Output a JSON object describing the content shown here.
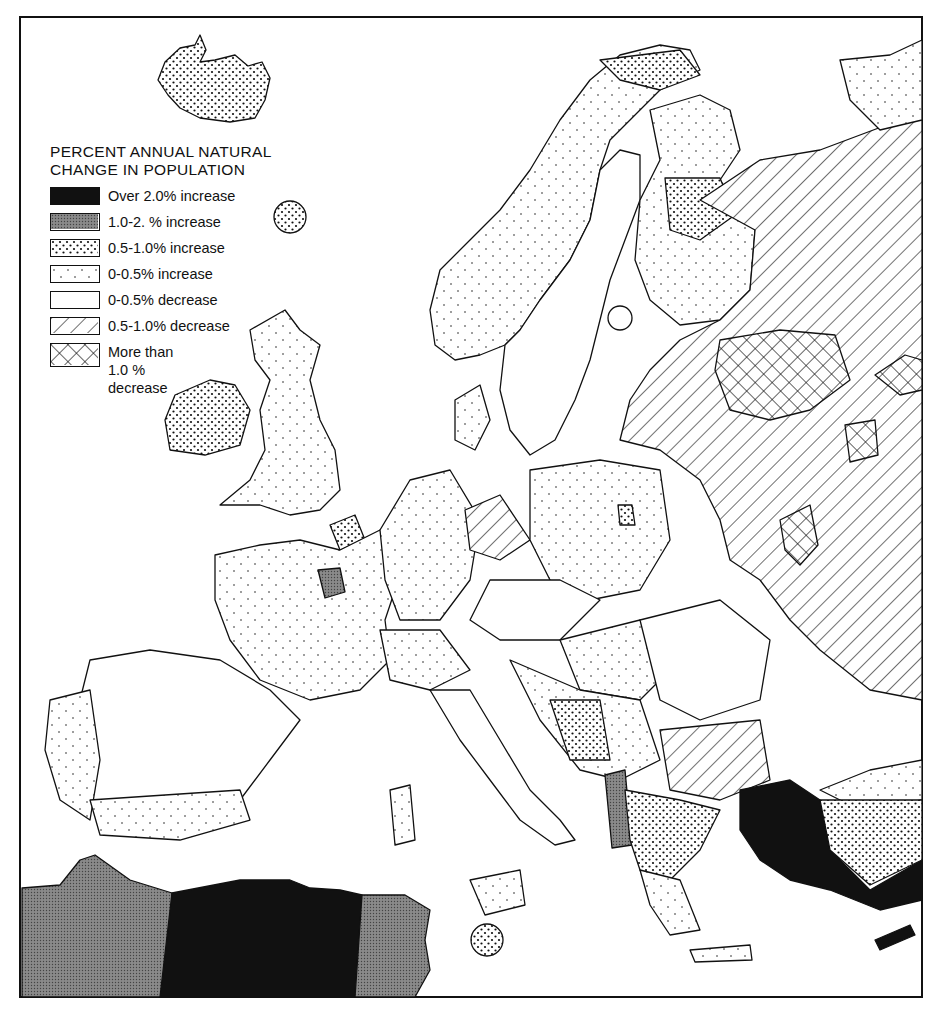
{
  "legend": {
    "title_line1": "PERCENT ANNUAL NATURAL",
    "title_line2": "CHANGE IN POPULATION",
    "items": [
      {
        "key": "over2",
        "label": "Over 2.0% increase",
        "pattern": "solid-black"
      },
      {
        "key": "1to2",
        "label": "1.0-2.  % increase",
        "pattern": "dense-gray"
      },
      {
        "key": "05to1",
        "label": "0.5-1.0% increase",
        "pattern": "dense-dots"
      },
      {
        "key": "0to05inc",
        "label": "0-0.5% increase",
        "pattern": "sparse-dots"
      },
      {
        "key": "0to05dec",
        "label": "0-0.5% decrease",
        "pattern": "blank"
      },
      {
        "key": "05to1dec",
        "label": "0.5-1.0% decrease",
        "pattern": "diagonal-hatch"
      },
      {
        "key": "over1dec",
        "label_line1": "More than",
        "label_line2": "1.0 %",
        "label_line3": "decrease",
        "pattern": "cross-hatch"
      }
    ]
  },
  "colors": {
    "ink": "#111111",
    "gray_fill": "#7a7a7a",
    "background": "#ffffff"
  }
}
